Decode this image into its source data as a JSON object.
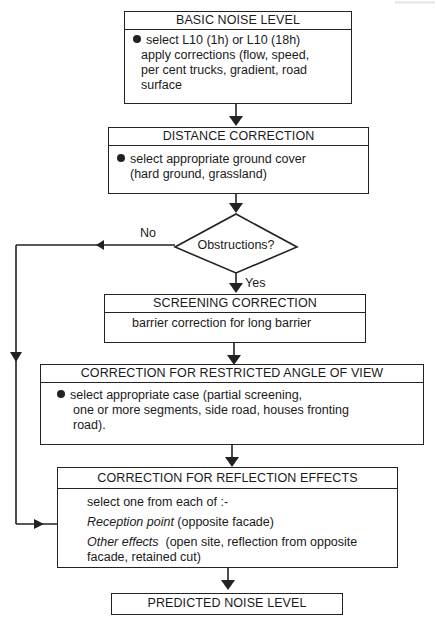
{
  "flowchart": {
    "basic_noise_level": {
      "title": "BASIC NOISE LEVEL",
      "lines": [
        "select L10 (1h) or L10 (18h)",
        "apply corrections (flow, speed,",
        "per cent trucks, gradient, road",
        "surface"
      ]
    },
    "distance_correction": {
      "title": "DISTANCE CORRECTION",
      "lines": [
        "select appropriate ground cover",
        "(hard ground, grassland)"
      ]
    },
    "decision": {
      "question": "Obstructions?",
      "no_label": "No",
      "yes_label": "Yes"
    },
    "screening_correction": {
      "title": "SCREENING CORRECTION",
      "lines": [
        "barrier correction for long barrier"
      ]
    },
    "restricted_angle": {
      "title": "CORRECTION FOR RESTRICTED ANGLE OF VIEW",
      "lines": [
        "select appropriate case (partial screening,",
        "one or more segments, side road, houses fronting",
        "road)."
      ]
    },
    "reflection_effects": {
      "title": "CORRECTION FOR REFLECTION EFFECTS",
      "intro": "select one from each of :-",
      "reception_label": "Reception point",
      "reception_text": " (opposite facade)",
      "other_label": "Other effects",
      "other_text": "  (open site, reflection from opposite",
      "other_text2": "facade, retained cut)"
    },
    "predicted": {
      "title": "PREDICTED NOISE LEVEL"
    }
  }
}
